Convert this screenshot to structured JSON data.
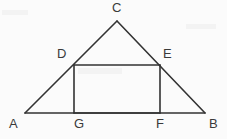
{
  "figure": {
    "kind": "geometry-diagram",
    "background_color": "#fbfbfb",
    "stroke_color": "#333333",
    "label_color": "#3a3a3a",
    "stroke_width": 1.6,
    "canvas": {
      "width": 227,
      "height": 139
    }
  },
  "points": {
    "A": {
      "label": "A",
      "x": 25,
      "y": 113,
      "label_x": 9,
      "label_y": 117
    },
    "B": {
      "label": "B",
      "x": 205,
      "y": 113,
      "label_x": 209,
      "label_y": 117
    },
    "C": {
      "label": "C",
      "x": 117,
      "y": 21,
      "label_x": 112,
      "label_y": 1
    },
    "D": {
      "label": "D",
      "x": 74,
      "y": 65,
      "label_x": 57,
      "label_y": 47
    },
    "E": {
      "label": "E",
      "x": 160,
      "y": 65,
      "label_x": 163,
      "label_y": 47
    },
    "F": {
      "label": "F",
      "x": 160,
      "y": 113,
      "label_x": 156,
      "label_y": 117
    },
    "G": {
      "label": "G",
      "x": 74,
      "y": 113,
      "label_x": 74,
      "label_y": 117
    }
  },
  "shapes": {
    "triangle": {
      "name": "triangle-ABC",
      "vertices": "A,B,C",
      "points": "25,113 205,113 117,21"
    },
    "rectangle": {
      "name": "rectangle-DEFG",
      "vertices": "D,E,F,G",
      "points": "74,65 160,65 160,113 74,113"
    }
  },
  "segments": [
    {
      "name": "segment-AC",
      "from": "A",
      "to": "C",
      "x1": 25,
      "y1": 113,
      "x2": 117,
      "y2": 21
    },
    {
      "name": "segment-CB",
      "from": "C",
      "to": "B",
      "x1": 117,
      "y1": 21,
      "x2": 205,
      "y2": 113
    },
    {
      "name": "segment-AB",
      "from": "A",
      "to": "B",
      "x1": 25,
      "y1": 113,
      "x2": 205,
      "y2": 113
    },
    {
      "name": "segment-DE",
      "from": "D",
      "to": "E",
      "x1": 74,
      "y1": 65,
      "x2": 160,
      "y2": 65
    },
    {
      "name": "segment-DG",
      "from": "D",
      "to": "G",
      "x1": 74,
      "y1": 65,
      "x2": 74,
      "y2": 113
    },
    {
      "name": "segment-EF",
      "from": "E",
      "to": "F",
      "x1": 160,
      "y1": 65,
      "x2": 160,
      "y2": 113
    },
    {
      "name": "segment-GF",
      "from": "G",
      "to": "F",
      "x1": 74,
      "y1": 113,
      "x2": 160,
      "y2": 113
    }
  ]
}
